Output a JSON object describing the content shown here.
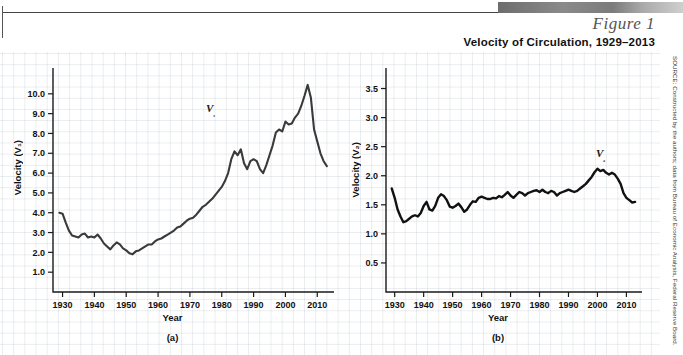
{
  "header": {
    "figure_number": "Figure 1",
    "title": "Velocity of Circulation, 1929–2013",
    "source": "SOURCE: Constructed by the authors; data from Bureau of Economic Analysis, Federal Reserve Board."
  },
  "chart_data": [
    {
      "type": "line",
      "panel": "(a)",
      "title": "Velocity of Circulation, 1929–2013",
      "xlabel": "Year",
      "ylabel": "Velocity (V₁)",
      "series_label": "V₁",
      "grid": true,
      "legend": "inline-annotation",
      "xlim": [
        1927,
        2014
      ],
      "ylim": [
        0.0,
        11.0
      ],
      "xticks": [
        1930,
        1940,
        1950,
        1960,
        1970,
        1980,
        1990,
        2000,
        2010
      ],
      "yticks": [
        1.0,
        2.0,
        3.0,
        4.0,
        5.0,
        6.0,
        7.0,
        8.0,
        9.0,
        10.0
      ],
      "ytick_labels": [
        "1.0",
        "2.0",
        "3.0",
        "4.0",
        "5.0",
        "6.0",
        "7.0",
        "8.0",
        "9.0",
        "10.0"
      ],
      "x": [
        1929,
        1930,
        1931,
        1932,
        1933,
        1934,
        1935,
        1936,
        1937,
        1938,
        1939,
        1940,
        1941,
        1942,
        1943,
        1944,
        1945,
        1946,
        1947,
        1948,
        1949,
        1950,
        1951,
        1952,
        1953,
        1954,
        1955,
        1956,
        1957,
        1958,
        1959,
        1960,
        1961,
        1962,
        1963,
        1964,
        1965,
        1966,
        1967,
        1968,
        1969,
        1970,
        1971,
        1972,
        1973,
        1974,
        1975,
        1976,
        1977,
        1978,
        1979,
        1980,
        1981,
        1982,
        1983,
        1984,
        1985,
        1986,
        1987,
        1988,
        1989,
        1990,
        1991,
        1992,
        1993,
        1994,
        1995,
        1996,
        1997,
        1998,
        1999,
        2000,
        2001,
        2002,
        2003,
        2004,
        2005,
        2006,
        2007,
        2008,
        2009,
        2010,
        2011,
        2012,
        2013
      ],
      "y": [
        4.0,
        3.95,
        3.5,
        3.1,
        2.85,
        2.8,
        2.75,
        2.9,
        2.95,
        2.75,
        2.8,
        2.75,
        2.9,
        2.7,
        2.45,
        2.3,
        2.15,
        2.35,
        2.5,
        2.4,
        2.2,
        2.1,
        1.95,
        1.9,
        2.05,
        2.1,
        2.2,
        2.3,
        2.4,
        2.4,
        2.55,
        2.65,
        2.7,
        2.8,
        2.9,
        3.0,
        3.1,
        3.25,
        3.3,
        3.45,
        3.6,
        3.7,
        3.75,
        3.9,
        4.1,
        4.3,
        4.4,
        4.55,
        4.7,
        4.9,
        5.1,
        5.3,
        5.6,
        6.0,
        6.7,
        7.1,
        6.9,
        7.2,
        6.5,
        6.2,
        6.6,
        6.7,
        6.6,
        6.2,
        6.0,
        6.4,
        6.9,
        7.4,
        8.05,
        8.2,
        8.1,
        8.6,
        8.45,
        8.5,
        8.8,
        9.0,
        9.4,
        9.9,
        10.45,
        9.8,
        8.2,
        7.6,
        7.0,
        6.6,
        6.35
      ]
    },
    {
      "type": "line",
      "panel": "(b)",
      "title": "Velocity of Circulation, 1929–2013",
      "xlabel": "Year",
      "ylabel": "Velocity (V₂)",
      "series_label": "V₂",
      "grid": true,
      "legend": "inline-annotation",
      "xlim": [
        1927,
        2014
      ],
      "ylim": [
        0.0,
        3.75
      ],
      "xticks": [
        1930,
        1940,
        1950,
        1960,
        1970,
        1980,
        1990,
        2000,
        2010
      ],
      "yticks": [
        0.5,
        1.0,
        1.5,
        2.0,
        2.5,
        3.0,
        3.5
      ],
      "ytick_labels": [
        "0.5",
        "1.0",
        "1.5",
        "2.0",
        "2.5",
        "3.0",
        "3.5"
      ],
      "x": [
        1929,
        1930,
        1931,
        1932,
        1933,
        1934,
        1935,
        1936,
        1937,
        1938,
        1939,
        1940,
        1941,
        1942,
        1943,
        1944,
        1945,
        1946,
        1947,
        1948,
        1949,
        1950,
        1951,
        1952,
        1953,
        1954,
        1955,
        1956,
        1957,
        1958,
        1959,
        1960,
        1961,
        1962,
        1963,
        1964,
        1965,
        1966,
        1967,
        1968,
        1969,
        1970,
        1971,
        1972,
        1973,
        1974,
        1975,
        1976,
        1977,
        1978,
        1979,
        1980,
        1981,
        1982,
        1983,
        1984,
        1985,
        1986,
        1987,
        1988,
        1989,
        1990,
        1991,
        1992,
        1993,
        1994,
        1995,
        1996,
        1997,
        1998,
        1999,
        2000,
        2001,
        2002,
        2003,
        2004,
        2005,
        2006,
        2007,
        2008,
        2009,
        2010,
        2011,
        2012,
        2013
      ],
      "y": [
        1.78,
        1.62,
        1.42,
        1.3,
        1.2,
        1.22,
        1.26,
        1.3,
        1.32,
        1.3,
        1.36,
        1.48,
        1.55,
        1.42,
        1.4,
        1.48,
        1.62,
        1.68,
        1.65,
        1.58,
        1.47,
        1.45,
        1.48,
        1.52,
        1.46,
        1.38,
        1.42,
        1.5,
        1.56,
        1.55,
        1.62,
        1.64,
        1.62,
        1.6,
        1.6,
        1.62,
        1.61,
        1.65,
        1.63,
        1.67,
        1.72,
        1.66,
        1.62,
        1.67,
        1.72,
        1.7,
        1.66,
        1.7,
        1.72,
        1.74,
        1.75,
        1.72,
        1.76,
        1.72,
        1.7,
        1.74,
        1.72,
        1.66,
        1.7,
        1.72,
        1.74,
        1.76,
        1.74,
        1.72,
        1.74,
        1.78,
        1.82,
        1.86,
        1.92,
        1.98,
        2.06,
        2.12,
        2.08,
        2.1,
        2.05,
        2.02,
        2.05,
        2.02,
        1.95,
        1.86,
        1.7,
        1.62,
        1.58,
        1.54,
        1.55
      ]
    }
  ]
}
